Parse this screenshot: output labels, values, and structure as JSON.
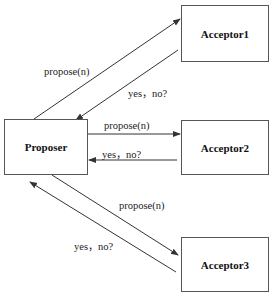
{
  "nodes": {
    "proposer": "Proposer",
    "acceptor1": "Acceptor1",
    "acceptor2": "Acceptor2",
    "acceptor3": "Acceptor3"
  },
  "edges": {
    "a1_propose": "propose(n)",
    "a1_reply": "yes，no?",
    "a2_propose": "propose(n)",
    "a2_reply": "yes，no?",
    "a3_propose": "propose(n)",
    "a3_reply": "yes，no?"
  }
}
